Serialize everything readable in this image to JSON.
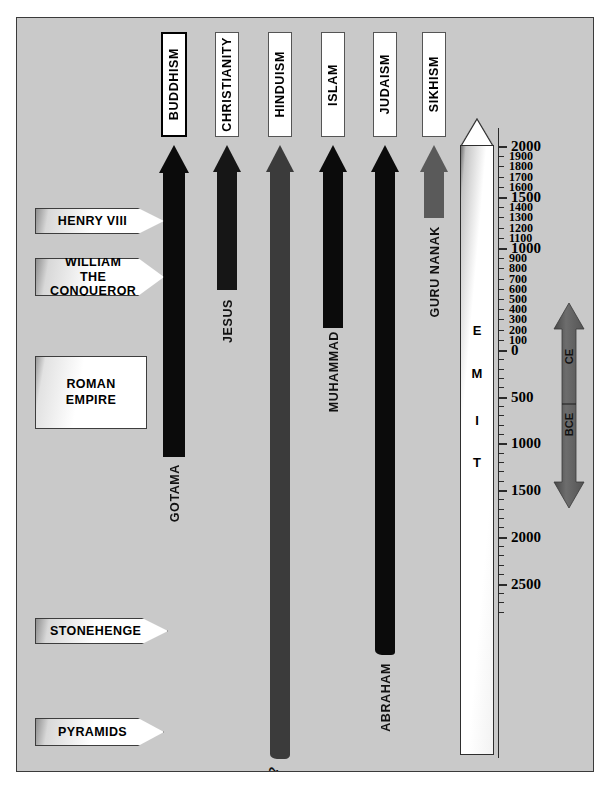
{
  "diagram": {
    "background_color": "#c9c9c9",
    "border_color": "#3a3a3a"
  },
  "religions": [
    {
      "name": "BUDDHISM",
      "founder": "GOTAMA",
      "color": "#0b0b0b",
      "start_label": "c. 500 BCE"
    },
    {
      "name": "CHRISTIANITY",
      "founder": "JESUS",
      "color": "#161616",
      "start_label": "c. 0 CE"
    },
    {
      "name": "HINDUISM",
      "founder": "?",
      "color": "#3b3b3b",
      "start_label": "unknown"
    },
    {
      "name": "ISLAM",
      "founder": "MUHAMMAD",
      "color": "#0b0b0b",
      "start_label": "c. 600 CE"
    },
    {
      "name": "JUDAISM",
      "founder": "ABRAHAM",
      "color": "#0b0b0b",
      "start_label": "c. 1800 BCE"
    },
    {
      "name": "SIKHISM",
      "founder": "GURU NANAK",
      "color": "#5a5a5a",
      "start_label": "c. 1500 CE"
    }
  ],
  "events": [
    {
      "label": "HENRY VIII",
      "shape": "banner"
    },
    {
      "label": "WILLIAM THE\nCONQUEROR",
      "shape": "banner"
    },
    {
      "label": "ROMAN\nEMPIRE",
      "shape": "box"
    },
    {
      "label": "STONEHENGE",
      "shape": "banner"
    },
    {
      "label": "PYRAMIDS",
      "shape": "banner"
    }
  ],
  "time_axis": {
    "caption_letters": [
      "T",
      "I",
      "M",
      "E"
    ],
    "caption": "TIME",
    "ce_labels_major": [
      "2000",
      "1500",
      "1000"
    ],
    "ce_labels_minor": [
      "1900",
      "1800",
      "1700",
      "1600",
      "1400",
      "1300",
      "1200",
      "1100",
      "900",
      "800",
      "700",
      "600",
      "500",
      "400",
      "300",
      "200",
      "100"
    ],
    "zero_label": "0",
    "bce_labels_major": [
      "500",
      "1000",
      "1500",
      "2000",
      "2500"
    ]
  },
  "era_arrow": {
    "upper_label": "CE",
    "lower_label": "BCE",
    "color": "#5e5e5e"
  },
  "chart_data": {
    "type": "bar",
    "xlabel": "Religion",
    "ylabel": "Year",
    "ylim": [
      -2800,
      2000
    ],
    "grid": false,
    "legend": "none",
    "categories": [
      "BUDDHISM",
      "CHRISTIANITY",
      "HINDUISM",
      "ISLAM",
      "JUDAISM",
      "SIKHISM"
    ],
    "series": [
      {
        "name": "Founding year (start of arrow)",
        "values": [
          -500,
          0,
          -2800,
          600,
          -1800,
          1500
        ]
      },
      {
        "name": "Present (end of arrow)",
        "values": [
          2000,
          2000,
          2000,
          2000,
          2000,
          2000
        ]
      }
    ],
    "founders": [
      "GOTAMA",
      "JESUS",
      "?",
      "MUHAMMAD",
      "ABRAHAM",
      "GURU NANAK"
    ],
    "annotations": [
      {
        "text": "HENRY VIII",
        "year": 1520
      },
      {
        "text": "WILLIAM THE CONQUEROR",
        "year": 1066
      },
      {
        "text": "ROMAN EMPIRE",
        "year": 100
      },
      {
        "text": "STONEHENGE",
        "year": -2400
      },
      {
        "text": "PYRAMIDS",
        "year": -2600
      }
    ],
    "axis_ticks_ce": [
      2000,
      1900,
      1800,
      1700,
      1600,
      1500,
      1400,
      1300,
      1200,
      1100,
      1000,
      900,
      800,
      700,
      600,
      500,
      400,
      300,
      200,
      100,
      0
    ],
    "axis_ticks_bce": [
      -500,
      -1000,
      -1500,
      -2000,
      -2500
    ]
  }
}
